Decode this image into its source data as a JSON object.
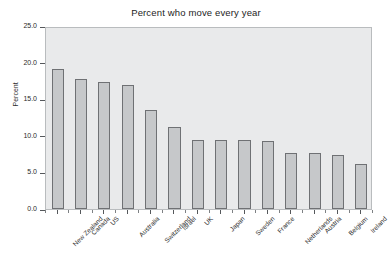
{
  "chart_data": {
    "type": "bar",
    "title": "Percent who move every year",
    "xlabel": "",
    "ylabel": "Percent",
    "ylim": [
      0.0,
      25.0
    ],
    "yticks": [
      "0.0",
      "5.0",
      "10.0",
      "15.0",
      "20.0",
      "25.0"
    ],
    "ytick_values": [
      0.0,
      5.0,
      10.0,
      15.0,
      20.0,
      25.0
    ],
    "grid": false,
    "legend": "none",
    "categories": [
      "New Zealand",
      "Canada",
      "US",
      "Australia",
      "Switzerland",
      "Israel",
      "UK",
      "Japan",
      "Sweden",
      "France",
      "Netherlands",
      "Austria",
      "Belgium",
      "Ireland"
    ],
    "values": [
      19.4,
      18.0,
      17.6,
      17.1,
      13.7,
      11.3,
      9.6,
      9.5,
      9.5,
      9.4,
      7.8,
      7.7,
      7.4,
      6.2
    ],
    "bar_fill_color": "#c6c8ca",
    "bar_edge_color": "#6f7174",
    "plot_background_color": "#e9eaeb",
    "figure_background_color": "#ffffff",
    "text_color": "#2a2a2a"
  }
}
